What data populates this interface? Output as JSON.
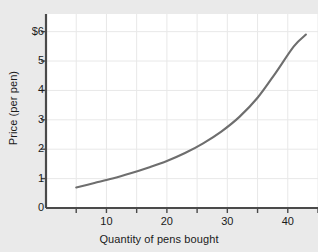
{
  "chart_data": {
    "type": "line",
    "title": "",
    "xlabel": "Quantity of pens bought",
    "ylabel": "Price (per pen)",
    "xlim": [
      0,
      45
    ],
    "ylim": [
      0,
      6.6
    ],
    "grid": true,
    "legend": null,
    "x_ticks": [
      {
        "value": 10,
        "label": "10"
      },
      {
        "value": 20,
        "label": "20"
      },
      {
        "value": 30,
        "label": "30"
      },
      {
        "value": 40,
        "label": "40"
      }
    ],
    "x_minor_ticks": [
      5,
      15,
      25,
      35,
      45
    ],
    "y_ticks": [
      {
        "value": 0,
        "label": "0"
      },
      {
        "value": 1,
        "label": "1"
      },
      {
        "value": 2,
        "label": "2"
      },
      {
        "value": 3,
        "label": "3"
      },
      {
        "value": 4,
        "label": "4"
      },
      {
        "value": 5,
        "label": "5"
      },
      {
        "value": 6,
        "label": "$6"
      }
    ],
    "series": [
      {
        "name": "supply-curve",
        "color": "#6e6e6e",
        "x": [
          5,
          8,
          11,
          14,
          17,
          20,
          23,
          26,
          29,
          32,
          35,
          38,
          41,
          43
        ],
        "values": [
          0.7,
          0.85,
          1.0,
          1.18,
          1.38,
          1.6,
          1.87,
          2.2,
          2.6,
          3.1,
          3.75,
          4.6,
          5.5,
          5.9
        ]
      }
    ]
  },
  "colors": {
    "page_background": "#eaeaea",
    "plot_background": "#ffffff",
    "axis": "#4a4a4a",
    "grid": "#e8e8e8",
    "curve": "#6e6e6e",
    "text": "#1a1a1a"
  }
}
